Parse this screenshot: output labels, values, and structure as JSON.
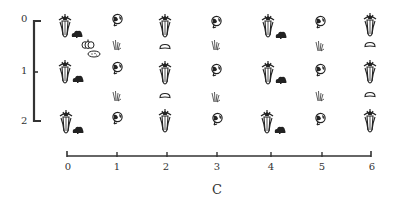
{
  "diagram": {
    "x_axis": {
      "title": "C",
      "ticks": [
        "0",
        "1",
        "2",
        "3",
        "4",
        "5",
        "6"
      ],
      "tick_px": [
        67,
        117,
        167,
        217,
        267,
        317,
        369
      ]
    },
    "y_axis": {
      "ticks": [
        "0",
        "1",
        "2"
      ],
      "tick_px": [
        20,
        72,
        122
      ]
    },
    "colors": {
      "ink": "#2a2a2a",
      "background": "#ffffff"
    },
    "legend_icons": [
      "corn-icon",
      "bush-bean-icon",
      "flower-cabbage-icon",
      "grass-icon",
      "squash-icon",
      "pumpkin-icon",
      "potato-icon"
    ],
    "rows": [
      {
        "row": 0,
        "items": [
          {
            "icon": "corn",
            "x": 0,
            "with": "bush"
          },
          {
            "icon": "flower",
            "x": 1
          },
          {
            "icon": "corn",
            "x": 2
          },
          {
            "icon": "flower",
            "x": 3
          },
          {
            "icon": "corn",
            "x": 4,
            "with": "bush"
          },
          {
            "icon": "flower",
            "x": 5
          },
          {
            "icon": "corn",
            "x": 6
          }
        ]
      },
      {
        "row": 0.5,
        "items": [
          {
            "icon": "pumpkin",
            "x": 0.45
          },
          {
            "icon": "potato",
            "x": 0.5
          },
          {
            "icon": "grass",
            "x": 1
          },
          {
            "icon": "squash",
            "x": 2
          },
          {
            "icon": "grass",
            "x": 3
          },
          {
            "icon": "grass",
            "x": 5
          },
          {
            "icon": "squash",
            "x": 6
          }
        ]
      },
      {
        "row": 1,
        "items": [
          {
            "icon": "corn",
            "x": 0,
            "with": "bush"
          },
          {
            "icon": "flower",
            "x": 1
          },
          {
            "icon": "corn",
            "x": 2
          },
          {
            "icon": "flower",
            "x": 3
          },
          {
            "icon": "corn",
            "x": 4,
            "with": "bush"
          },
          {
            "icon": "flower",
            "x": 5
          },
          {
            "icon": "corn",
            "x": 6
          }
        ]
      },
      {
        "row": 1.5,
        "items": [
          {
            "icon": "grass",
            "x": 1
          },
          {
            "icon": "squash",
            "x": 2
          },
          {
            "icon": "grass",
            "x": 3
          },
          {
            "icon": "grass",
            "x": 5
          },
          {
            "icon": "squash",
            "x": 6
          }
        ]
      },
      {
        "row": 2,
        "items": [
          {
            "icon": "corn",
            "x": 0,
            "with": "bush"
          },
          {
            "icon": "flower",
            "x": 1
          },
          {
            "icon": "corn",
            "x": 2
          },
          {
            "icon": "flower",
            "x": 3
          },
          {
            "icon": "corn",
            "x": 4,
            "with": "bush"
          },
          {
            "icon": "flower",
            "x": 5
          },
          {
            "icon": "corn",
            "x": 6
          }
        ]
      }
    ]
  }
}
